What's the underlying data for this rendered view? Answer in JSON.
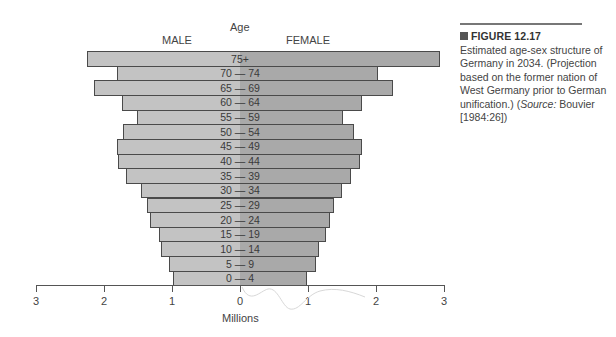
{
  "chart_data": {
    "type": "bar",
    "orientation": "horizontal",
    "subtype": "population-pyramid",
    "title": "",
    "xlabel": "Millions",
    "ylabel": "Age",
    "categories": [
      "75+",
      "70 — 74",
      "65 — 69",
      "60 — 64",
      "55 — 59",
      "50 — 54",
      "45 — 49",
      "40 — 44",
      "35 — 39",
      "30 — 34",
      "25 — 29",
      "20 — 24",
      "15 — 19",
      "10 — 14",
      "5 — 9",
      "0 — 4"
    ],
    "series": [
      {
        "name": "MALE",
        "side": "left",
        "color": "#c3c3c3",
        "values": [
          2.25,
          1.81,
          2.15,
          1.74,
          1.51,
          1.72,
          1.81,
          1.79,
          1.68,
          1.46,
          1.37,
          1.32,
          1.19,
          1.16,
          1.04,
          0.99
        ]
      },
      {
        "name": "FEMALE",
        "side": "right",
        "color": "#a9a9a9",
        "values": [
          2.94,
          2.03,
          2.25,
          1.79,
          1.51,
          1.68,
          1.79,
          1.76,
          1.63,
          1.5,
          1.38,
          1.32,
          1.26,
          1.16,
          1.12,
          0.99
        ]
      }
    ],
    "xlim": [
      -3,
      3
    ],
    "xticks": [
      -3,
      -2,
      -1,
      0,
      1,
      2,
      3
    ],
    "xtick_labels": [
      "3",
      "2",
      "1",
      "0",
      "1",
      "2",
      "3"
    ],
    "grid": false,
    "legend": {
      "position": "top",
      "entries": [
        "MALE",
        "FEMALE"
      ]
    }
  },
  "labels": {
    "age": "Age",
    "male": "MALE",
    "female": "FEMALE",
    "millions": "Millions"
  },
  "caption": {
    "figure_number": "FIGURE 12.17",
    "text": "Estimated age-sex structure of Germany in 2034. (Projection based on the former nation of West Germany prior to German unification.)",
    "source_prefix": "(",
    "source_label": "Source:",
    "source_text": " Bouvier [1984:26])"
  }
}
